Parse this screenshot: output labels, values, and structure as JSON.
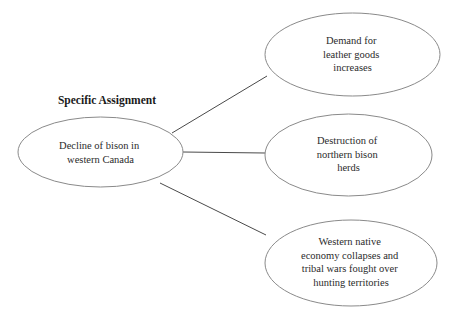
{
  "diagram": {
    "heading": "Specific Assignment",
    "root": {
      "label_lines": [
        "Decline of bison in",
        "western Canada"
      ],
      "cx": 100.5,
      "cy": 152,
      "rx": 82.5,
      "ry": 35
    },
    "branches": [
      {
        "name": "demand-leather",
        "label_lines": [
          "Demand for",
          "leather goods",
          "increases"
        ],
        "cx": 352.5,
        "cy": 54.5,
        "rx": 87.5,
        "ry": 41.5,
        "connector": {
          "x1": 172,
          "y1": 133,
          "x2": 267,
          "y2": 76
        }
      },
      {
        "name": "destruction-herds",
        "label_lines": [
          "Destruction of",
          "northern bison",
          "herds"
        ],
        "cx": 348.5,
        "cy": 155,
        "rx": 83.5,
        "ry": 41,
        "connector": {
          "x1": 183,
          "y1": 152,
          "x2": 265,
          "y2": 153
        }
      },
      {
        "name": "economy-collapse",
        "label_lines": [
          "Western native",
          "economy collapses and",
          "tribal wars fought over",
          "hunting territories"
        ],
        "cx": 351,
        "cy": 263,
        "rx": 86,
        "ry": 43,
        "connector": {
          "x1": 160,
          "y1": 183,
          "x2": 266,
          "y2": 235
        }
      }
    ],
    "colors": {
      "ellipse_stroke": "#8a8a8a",
      "connector_stroke": "#4a4a4a",
      "text": "#2b2b2b",
      "heading_text": "#1a1a1a",
      "background": "#ffffff"
    }
  }
}
